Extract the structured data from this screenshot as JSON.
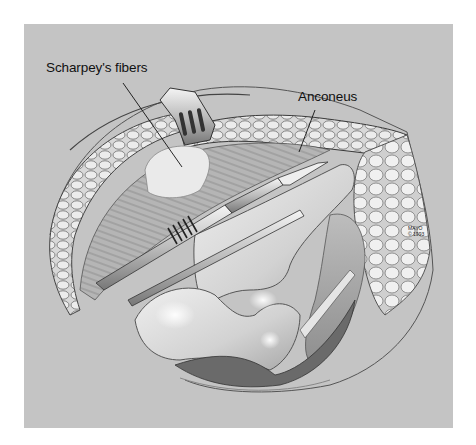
{
  "figure": {
    "background_color": "#c4c4c4",
    "page_color": "#ffffff",
    "labels": [
      {
        "text": "Scharpey's fibers",
        "leader": {
          "x1": 123,
          "y1": 83,
          "x2": 182,
          "y2": 167
        }
      },
      {
        "text": "Anconeus",
        "leader": {
          "x1": 315,
          "y1": 110,
          "x2": 299,
          "y2": 152
        }
      }
    ],
    "copyright": {
      "line1": "MAYO",
      "line2": "© 1993"
    }
  }
}
